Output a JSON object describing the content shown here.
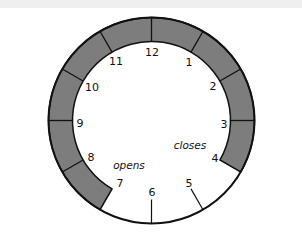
{
  "diagram": {
    "type": "clock-face",
    "center": [
      151.5,
      120.5
    ],
    "outer_radius": 103,
    "inner_radius": 79,
    "shade_color": "#7d7d7d",
    "stroke_color": "#111111",
    "shaded_arc": {
      "from_hour": 7,
      "to_hour": 4,
      "direction": "clockwise"
    },
    "dividers_hours": [
      8,
      9,
      10,
      11,
      12,
      1,
      2,
      3
    ],
    "tick_hours": [
      5,
      6
    ],
    "hour_labels": [
      {
        "text": "12",
        "x": 152,
        "y": 52
      },
      {
        "text": "1",
        "x": 189,
        "y": 62
      },
      {
        "text": "2",
        "x": 213,
        "y": 86
      },
      {
        "text": "3",
        "x": 224,
        "y": 124
      },
      {
        "text": "4",
        "x": 215,
        "y": 158
      },
      {
        "text": "5",
        "x": 189,
        "y": 183
      },
      {
        "text": "6",
        "x": 152,
        "y": 192
      },
      {
        "text": "7",
        "x": 120,
        "y": 183
      },
      {
        "text": "8",
        "x": 91,
        "y": 157
      },
      {
        "text": "9",
        "x": 80,
        "y": 123
      },
      {
        "text": "10",
        "x": 92,
        "y": 87
      },
      {
        "text": "11",
        "x": 116,
        "y": 61
      }
    ],
    "annotations": [
      {
        "text": "closes",
        "x": 190,
        "y": 145
      },
      {
        "text": "opens",
        "x": 129,
        "y": 165
      }
    ]
  }
}
